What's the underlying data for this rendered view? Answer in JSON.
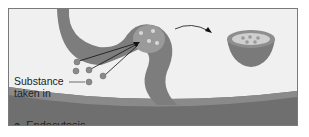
{
  "diagram": {
    "caption_prefix": "a.",
    "caption_title": "Endocytosis",
    "labels": {
      "substance": "Substance",
      "substance_line2": "taken in"
    },
    "colors": {
      "membrane": "#7d7d7d",
      "membrane_dark": "#5e5e5e",
      "background": "#f0f0f0",
      "particle": "#8a8a8a",
      "vesicle_interior": "#cfcfcf"
    }
  }
}
